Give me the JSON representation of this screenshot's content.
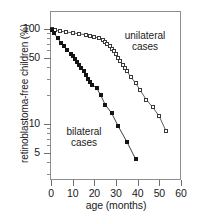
{
  "chart_data": {
    "type": "line",
    "title": "",
    "xlabel": "age (months)",
    "ylabel": "retinoblastoma-free children (%)",
    "xlim": [
      0,
      60
    ],
    "ylim": [
      3,
      130
    ],
    "yscale": "log",
    "xscale": "linear",
    "grid": false,
    "legend_position": "inline-annotations",
    "xticks": [
      "0",
      "10",
      "20",
      "30",
      "40",
      "50",
      "60"
    ],
    "xtick_values": [
      0,
      10,
      20,
      30,
      40,
      50,
      60
    ],
    "yticks": [
      "100",
      "50",
      "10",
      "5"
    ],
    "ytick_values": [
      100,
      50,
      10,
      5
    ],
    "ytick_minor_values": [
      90,
      80,
      70,
      60,
      40,
      30,
      20,
      9,
      8,
      7,
      6,
      4,
      3
    ],
    "series": [
      {
        "name": "unilateral cases",
        "marker": "open-square",
        "annotation": "unilateral\ncases",
        "annotation_line1": "unilateral",
        "annotation_line2": "cases",
        "x": [
          0.5,
          2,
          4,
          7,
          10,
          13,
          16,
          18,
          20,
          22,
          24,
          25,
          26,
          27,
          28,
          29,
          30,
          31,
          32,
          33,
          34,
          35,
          37,
          39,
          41,
          44,
          47,
          50,
          53
        ],
        "y": [
          99,
          97,
          95,
          93,
          91,
          89,
          87,
          85,
          83,
          80,
          76,
          73,
          70,
          66,
          62,
          58,
          54,
          50,
          46,
          42,
          39,
          36,
          31,
          27,
          23,
          18,
          15,
          12,
          8.5
        ]
      },
      {
        "name": "bilateral cases",
        "marker": "filled-square",
        "annotation": "bilateral\ncases",
        "annotation_line1": "bilateral",
        "annotation_line2": "cases",
        "x": [
          0.4,
          1.5,
          3,
          4.5,
          6,
          7.5,
          9,
          10,
          11,
          12,
          13,
          14,
          15,
          16,
          17,
          18,
          19,
          21,
          23,
          25,
          28,
          31,
          35,
          39
        ],
        "y": [
          98,
          90,
          80,
          72,
          66,
          60,
          55,
          52,
          48,
          45,
          42,
          39,
          36,
          33,
          30,
          28,
          26,
          24,
          20,
          16,
          13,
          9.5,
          6.5,
          4.3
        ]
      }
    ]
  }
}
